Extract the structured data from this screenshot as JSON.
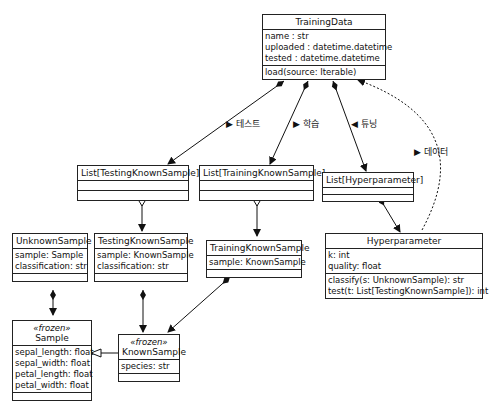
{
  "classes": {
    "training_data": {
      "name": "TrainingData",
      "attributes": [
        "name : str",
        "uploaded : datetime.datetime",
        "tested : datetime.datetime"
      ],
      "methods": [
        "load(source: Iterable)"
      ]
    },
    "list_testing": {
      "name": "List[TestingKnownSample]"
    },
    "list_training": {
      "name": "List[TrainingKnownSample]"
    },
    "list_hyper": {
      "name": "List[Hyperparameter]"
    },
    "unknown_sample": {
      "name": "UnknownSample",
      "attributes": [
        "sample: Sample",
        "classification: str"
      ]
    },
    "testing_known_sample": {
      "name": "TestingKnownSample",
      "attributes": [
        "sample: KnownSample",
        "classification: str"
      ]
    },
    "training_known_sample": {
      "name": "TrainingKnownSample",
      "attributes": [
        "sample: KnownSample"
      ]
    },
    "hyperparameter": {
      "name": "Hyperparameter",
      "attributes": [
        "k: int",
        "quality: float"
      ],
      "methods": [
        "classify(s: UnknownSample): str",
        "test(t: List[TestingKnownSample]): int"
      ]
    },
    "sample": {
      "stereotype": "«frozen»",
      "name": "Sample",
      "attributes": [
        "sepal_length: float",
        "sepal_width: float",
        "petal_length: float",
        "petal_width: float"
      ]
    },
    "known_sample": {
      "stereotype": "«frozen»",
      "name": "KnownSample",
      "attributes": [
        "species: str"
      ]
    }
  },
  "labels": {
    "test": "▶ 테스트",
    "train": "▶ 학습",
    "tune": "◀ 튜닝",
    "data": "▶ 데이터"
  }
}
